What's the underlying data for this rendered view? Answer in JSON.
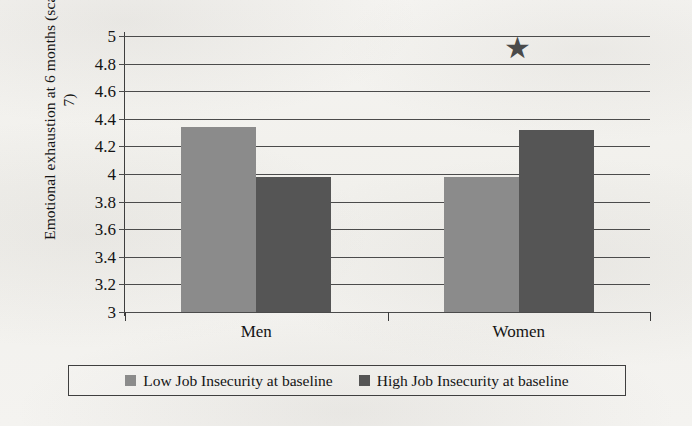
{
  "chart_data": {
    "type": "bar",
    "title": "",
    "xlabel": "",
    "ylabel": "Emotional exhaustion at 6 months (scale: 1–7)",
    "categories": [
      "Men",
      "Women"
    ],
    "series": [
      {
        "name": "Low Job Insecurity at baseline",
        "color": "#8b8b8b",
        "values": [
          4.34,
          3.98
        ]
      },
      {
        "name": "High Job Insecurity at baseline",
        "color": "#555555",
        "values": [
          3.98,
          4.32
        ]
      }
    ],
    "ylim": [
      3,
      5
    ],
    "ytick_step": 0.2,
    "ytick_labels": [
      "5",
      "4.8",
      "4.6",
      "4.4",
      "4.2",
      "4",
      "3.8",
      "3.6",
      "3.4",
      "3.2",
      "3"
    ],
    "ytick_values": [
      5,
      4.8,
      4.6,
      4.4,
      4.2,
      4,
      3.8,
      3.6,
      3.4,
      3.2,
      3
    ],
    "grid": true,
    "legend_position": "bottom",
    "annotations": [
      {
        "symbol": "★",
        "name": "significance-star",
        "category": "Women",
        "y": 4.9
      }
    ]
  },
  "legend": {
    "items": [
      {
        "label": "Low Job Insecurity at baseline",
        "swatch": "low"
      },
      {
        "label": "High Job Insecurity at baseline",
        "swatch": "high"
      }
    ]
  }
}
